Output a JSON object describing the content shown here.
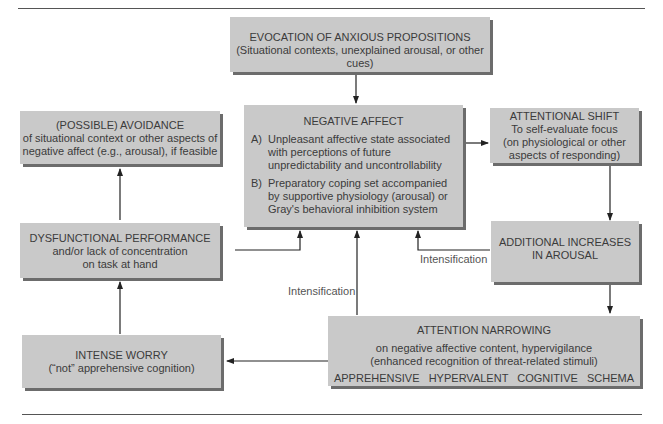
{
  "diagram": {
    "boxes": {
      "evocation": {
        "title": "EVOCATION OF ANXIOUS PROPOSITIONS",
        "lines": [
          "(Situational contexts, unexplained arousal, or other cues)"
        ]
      },
      "negative_affect": {
        "title": "NEGATIVE AFFECT",
        "items": [
          {
            "label": "A)",
            "text": "Unpleasant affective state associated with perceptions of future unpredictability and uncontrollability"
          },
          {
            "label": "B)",
            "text": "Preparatory coping set accompanied by supportive physiology (arousal) or Gray's behavioral inhibition system"
          }
        ]
      },
      "avoidance": {
        "title": "(POSSIBLE) AVOIDANCE",
        "lines": [
          "of situational context or other aspects of",
          "negative affect (e.g., arousal), if feasible"
        ]
      },
      "attentional_shift": {
        "title": "ATTENTIONAL SHIFT",
        "lines": [
          "To self-evaluate focus",
          "(on physiological or other",
          "aspects of responding)"
        ]
      },
      "dysfunctional_performance": {
        "title": "DYSFUNCTIONAL PERFORMANCE",
        "lines": [
          "and/or lack of concentration",
          "on task at hand"
        ]
      },
      "additional_increases": {
        "title": "ADDITIONAL INCREASES",
        "lines": [
          "IN AROUSAL"
        ]
      },
      "attention_narrowing": {
        "title": "ATTENTION NARROWING",
        "lines": [
          "on negative affective content, hypervigilance",
          "(enhanced recognition of threat-related stimuli)"
        ],
        "footer": "APPREHENSIVE   HYPERVALENT   COGNITIVE   SCHEMA"
      },
      "intense_worry": {
        "title": "INTENSE WORRY",
        "lines": [
          "(“not” apprehensive cognition)"
        ]
      }
    },
    "edge_labels": {
      "intensification_right": "Intensification",
      "intensification_center": "Intensification"
    },
    "colors": {
      "box_fill": "#c9c9c9",
      "box_shadow": "#6c6c6c",
      "line": "#222222",
      "text": "#3b3b3b"
    }
  }
}
